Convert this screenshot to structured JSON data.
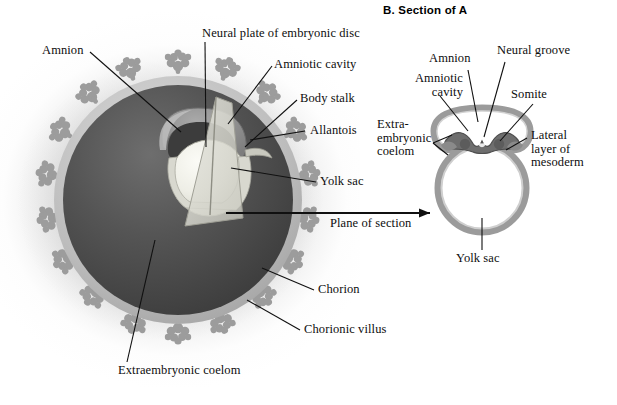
{
  "figure": {
    "panel_b_title": "B. Section of A"
  },
  "panel_a": {
    "labels": {
      "amnion": "Amnion",
      "neural_plate": "Neural plate of embryonic disc",
      "amniotic_cavity": "Amniotic cavity",
      "body_stalk": "Body stalk",
      "allantois": "Allantois",
      "yolk_sac": "Yolk sac",
      "plane_of_section": "Plane of section",
      "chorion": "Chorion",
      "chorionic_villus": "Chorionic villus",
      "extraembryonic_coelom": "Extraembryonic coelom"
    }
  },
  "panel_b": {
    "labels": {
      "amniotic_cavity_line1": "Amniotic",
      "amniotic_cavity_line2": "cavity",
      "amnion": "Amnion",
      "neural_groove": "Neural groove",
      "somite": "Somite",
      "extraembryonic_line1": "Extra-",
      "extraembryonic_line2": "embryonic",
      "extraembryonic_line3": "coelom",
      "lateral_mesoderm_line1": "Lateral",
      "lateral_mesoderm_line2": "layer of",
      "lateral_mesoderm_line3": "mesoderm",
      "yolk_sac": "Yolk sac"
    }
  },
  "colors": {
    "chorion_sphere_dark": "#4a4a4a",
    "chorion_rim": "#b9b9b9",
    "villus_grey": "#9a9a9a",
    "amnion_grey": "#8f8f8f",
    "yolk_sac_light": "#efefe8",
    "leader_line": "#101010",
    "background": "#ffffff",
    "outline_dark": "#5e5e5e"
  }
}
